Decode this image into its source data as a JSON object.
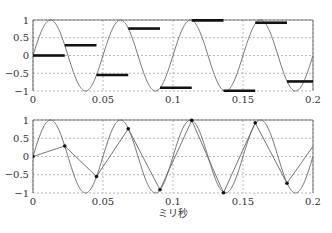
{
  "chart_data": [
    {
      "type": "line",
      "title": "",
      "description": "20 kHz sine sampled at 44.1 kHz with zero-order hold (step bars)",
      "xlabel": "",
      "ylabel": "",
      "xlim": [
        0,
        0.2
      ],
      "ylim": [
        -1,
        1
      ],
      "grid": true,
      "x_ticks": [
        0,
        0.05,
        0.1,
        0.15,
        0.2
      ],
      "x_tick_labels": [
        "0",
        "0.05",
        "0.1",
        "0.15",
        "0.2"
      ],
      "y_ticks": [
        1,
        0.5,
        0,
        -0.5,
        -1
      ],
      "y_tick_labels": [
        "1",
        "0.5",
        "0",
        "−0.5",
        "−1"
      ],
      "series": [
        {
          "name": "sine",
          "style": "thin-curve",
          "frequency_per_ms": 20
        },
        {
          "name": "sample-and-hold",
          "style": "thick-steps",
          "x": [
            0,
            0.02268,
            0.04535,
            0.06803,
            0.0907,
            0.11338,
            0.13605,
            0.15873,
            0.1814
          ],
          "values": [
            0,
            0.288,
            -0.549,
            0.759,
            -0.91,
            0.99,
            -0.995,
            0.923,
            -0.731
          ]
        }
      ]
    },
    {
      "type": "line",
      "title": "",
      "description": "20 kHz sine and linearly connected samples",
      "xlabel": "ミリ秒",
      "ylabel": "",
      "xlim": [
        0,
        0.2
      ],
      "ylim": [
        -1,
        1
      ],
      "grid": true,
      "x_ticks": [
        0,
        0.05,
        0.1,
        0.15,
        0.2
      ],
      "x_tick_labels": [
        "0",
        "0.05",
        "0.1",
        "0.15",
        "0.2"
      ],
      "y_ticks": [
        1,
        0.5,
        0,
        -0.5,
        -1
      ],
      "y_tick_labels": [
        "1",
        "0.5",
        "0",
        "−0.5",
        "−1"
      ],
      "series": [
        {
          "name": "sine",
          "style": "thin-curve",
          "frequency_per_ms": 20
        },
        {
          "name": "linear-samples",
          "style": "dots-connected",
          "x": [
            0,
            0.02268,
            0.04535,
            0.06803,
            0.0907,
            0.11338,
            0.13605,
            0.15873,
            0.1814,
            0.20408
          ],
          "values": [
            0,
            0.288,
            -0.549,
            0.759,
            -0.91,
            0.99,
            -0.995,
            0.923,
            -0.731,
            0.5
          ]
        }
      ]
    }
  ],
  "colors": {
    "axis": "#555555",
    "grid": "#888888",
    "curve": "#666666",
    "bars": "#111111",
    "text": "#333333"
  },
  "layout": {
    "panels": [
      {
        "x0": 33,
        "x1": 313,
        "y_top": 20,
        "y_bottom": 91
      },
      {
        "x0": 33,
        "x1": 313,
        "y_top": 120,
        "y_bottom": 193
      }
    ],
    "x_label_pos": {
      "x": 173,
      "y": 217
    }
  }
}
